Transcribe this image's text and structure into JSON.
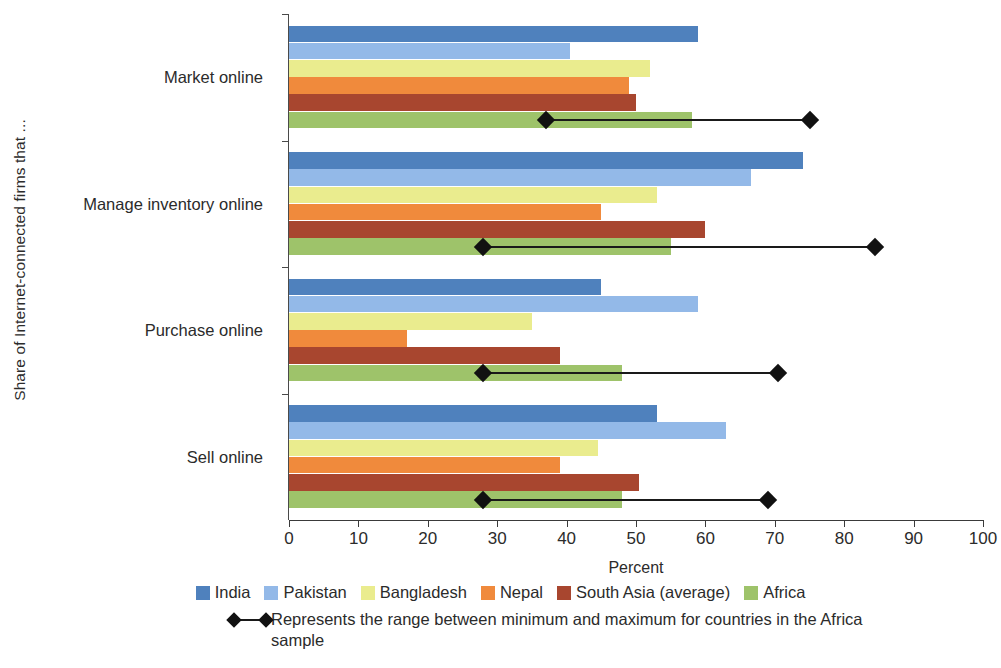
{
  "chart_data": {
    "type": "bar",
    "orientation": "horizontal",
    "title": "",
    "xlabel": "Percent",
    "ylabel": "Share of Internet-connected firms that ...",
    "xlim": [
      0,
      100
    ],
    "xticks": [
      0,
      10,
      20,
      30,
      40,
      50,
      60,
      70,
      80,
      90,
      100
    ],
    "xtick_labels": [
      "0",
      "10",
      "20",
      "30",
      "40",
      "50",
      "60",
      "70",
      "80",
      "90",
      "100"
    ],
    "grid": false,
    "legend_position": "bottom",
    "categories": [
      "Market online",
      "Manage inventory online",
      "Purchase online",
      "Sell online"
    ],
    "series": [
      {
        "name": "India",
        "color": "#4f81bd",
        "values": [
          59,
          74,
          45,
          53
        ]
      },
      {
        "name": "Pakistan",
        "color": "#93b9e8",
        "values": [
          40.5,
          66.5,
          59,
          63
        ]
      },
      {
        "name": "Bangladesh",
        "color": "#eaec8e",
        "values": [
          52,
          53,
          35,
          44.5
        ]
      },
      {
        "name": "Nepal",
        "color": "#f08a3c",
        "values": [
          49,
          45,
          17,
          39
        ]
      },
      {
        "name": "South Asia (average)",
        "color": "#a8462f",
        "values": [
          50,
          60,
          39,
          50.5
        ]
      },
      {
        "name": "Africa",
        "color": "#9ec36a",
        "values": [
          58,
          55,
          48,
          48
        ]
      }
    ],
    "ranges": [
      {
        "category": "Market online",
        "min": 37,
        "max": 75
      },
      {
        "category": "Manage inventory online",
        "min": 28,
        "max": 84.5
      },
      {
        "category": "Purchase online",
        "min": 28,
        "max": 70.5
      },
      {
        "category": "Sell online",
        "min": 28,
        "max": 69
      }
    ],
    "range_note": "Represents the range between minimum and maximum for countries in the Africa sample"
  },
  "legend": {
    "items": [
      {
        "label": "India",
        "color": "#4f81bd"
      },
      {
        "label": "Pakistan",
        "color": "#93b9e8"
      },
      {
        "label": "Bangladesh",
        "color": "#eaec8e"
      },
      {
        "label": "Nepal",
        "color": "#f08a3c"
      },
      {
        "label": "South Asia (average)",
        "color": "#a8462f"
      },
      {
        "label": "Africa",
        "color": "#9ec36a"
      }
    ],
    "range_note": "Represents the range between minimum and maximum for countries in the Africa sample"
  }
}
